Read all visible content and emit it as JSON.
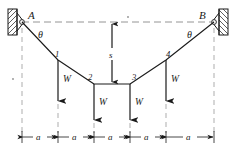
{
  "figure": {
    "supports": [
      {
        "id": "A",
        "label": "A",
        "x": 22,
        "y": 22,
        "side": "left"
      },
      {
        "id": "B",
        "label": "B",
        "x": 214,
        "y": 22,
        "side": "right"
      }
    ],
    "angle_labels": [
      {
        "label": "θ",
        "x": 41,
        "y": 36
      },
      {
        "label": "θ",
        "x": 190,
        "y": 36
      }
    ],
    "nodes": [
      {
        "label": "1",
        "x": 58,
        "y": 60
      },
      {
        "label": "2",
        "x": 94,
        "y": 84
      },
      {
        "label": "3",
        "x": 130,
        "y": 84
      },
      {
        "label": "4",
        "x": 166,
        "y": 60
      }
    ],
    "loads": [
      {
        "label": "W",
        "node": "1",
        "x": 58,
        "arrow_top": 60,
        "arrow_bottom": 105
      },
      {
        "label": "W",
        "node": "2",
        "x": 94,
        "arrow_top": 84,
        "arrow_bottom": 124
      },
      {
        "label": "W",
        "node": "3",
        "x": 130,
        "arrow_top": 84,
        "arrow_bottom": 124
      },
      {
        "label": "W",
        "node": "4",
        "x": 166,
        "arrow_top": 60,
        "arrow_bottom": 105
      }
    ],
    "sag_dimension": {
      "label": "s",
      "x": 112,
      "top": 22,
      "bottom": 84
    },
    "span_dimension": {
      "label": "a",
      "segment_labels": [
        "a",
        "a",
        "a",
        "a",
        "a"
      ],
      "y": 137,
      "ticks": [
        22,
        58,
        94,
        130,
        166,
        214
      ],
      "segment_count": 5
    },
    "datum_line": {
      "y": 22,
      "x_start": 22,
      "x_end": 214
    },
    "colors": {
      "ink": "#1a1a1a",
      "dashed": "#7a7a7a",
      "paper": "#ffffff"
    },
    "icons": {
      "left_support": "fixed-pin-support-icon",
      "right_support": "fixed-pin-support-icon",
      "load_arrow": "down-arrow-icon",
      "sag_arrow": "double-arrow-vertical-icon",
      "dim_arrow": "double-arrow-horizontal-icon"
    }
  }
}
